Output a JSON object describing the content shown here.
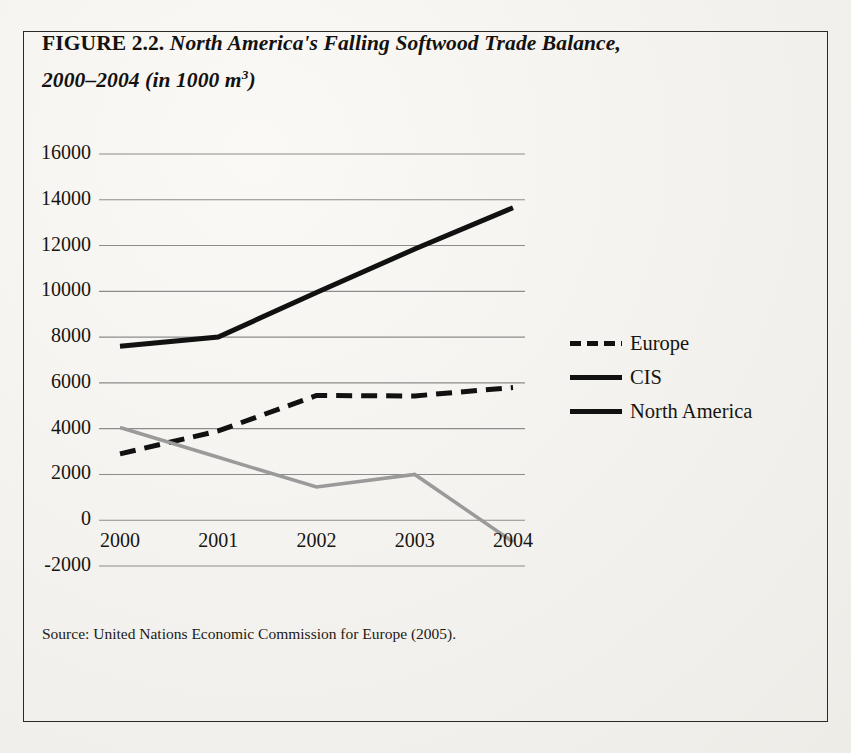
{
  "figure": {
    "label": "FIGURE 2.2.",
    "title_line1": "North America's Falling Softwood Trade Balance,",
    "title_line2_pre": "2000–2004 (in 1000 m",
    "title_line2_sup": "3",
    "title_line2_post": ")",
    "source": "Source: United Nations Economic Commission for Europe (2005)."
  },
  "legend": {
    "items": [
      {
        "label": "Europe",
        "style": "dashed",
        "color": "#111111"
      },
      {
        "label": "CIS",
        "style": "solid",
        "color": "#111111"
      },
      {
        "label": "North America",
        "style": "solid",
        "color": "#111111"
      }
    ]
  },
  "axis": {
    "y_ticks": [
      "16000",
      "14000",
      "12000",
      "10000",
      "8000",
      "6000",
      "4000",
      "2000",
      "0",
      "-2000"
    ],
    "x_ticks": [
      "2000",
      "2001",
      "2002",
      "2003",
      "2004"
    ]
  },
  "chart_data": {
    "type": "line",
    "title": "FIGURE 2.2. North America's Falling Softwood Trade Balance, 2000–2004 (in 1000 m3)",
    "xlabel": "",
    "ylabel": "",
    "x": [
      2000,
      2001,
      2002,
      2003,
      2004
    ],
    "categories": [
      "2000",
      "2001",
      "2002",
      "2003",
      "2004"
    ],
    "series": [
      {
        "name": "Europe",
        "values": [
          2900,
          3900,
          5450,
          5430,
          5800
        ],
        "style": "dashed",
        "color": "#111111",
        "width": 5
      },
      {
        "name": "CIS",
        "values": [
          7600,
          8000,
          9950,
          11850,
          13650
        ],
        "style": "solid",
        "color": "#111111",
        "width": 5
      },
      {
        "name": "North America",
        "values": [
          4050,
          2750,
          1450,
          2000,
          -950
        ],
        "style": "solid",
        "color": "#9a9a9a",
        "width": 3.5
      }
    ],
    "ylim": [
      -2000,
      16000
    ],
    "ytick_step": 2000,
    "grid": true,
    "grid_color": "#8c8c8c",
    "legend_position": "right",
    "units": "1000 m3",
    "source": "United Nations Economic Commission for Europe (2005)."
  }
}
